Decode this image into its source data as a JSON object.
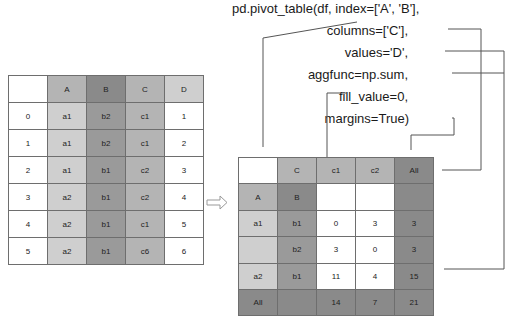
{
  "code": {
    "line1": "pd.pivot_table(df, index=['A', 'B'],",
    "line2": "columns=['C'],",
    "line3": "values='D',",
    "line4": "aggfunc=np.sum,",
    "line5": "fill_value=0,",
    "line6": "margins=True)"
  },
  "source_table": {
    "headers": [
      "",
      "A",
      "B",
      "C",
      "D"
    ],
    "rows": [
      [
        "0",
        "a1",
        "b2",
        "c1",
        "1"
      ],
      [
        "1",
        "a1",
        "b2",
        "c1",
        "2"
      ],
      [
        "2",
        "a1",
        "b1",
        "c2",
        "3"
      ],
      [
        "3",
        "a2",
        "b1",
        "c2",
        "4"
      ],
      [
        "4",
        "a2",
        "b1",
        "c1",
        "5"
      ],
      [
        "5",
        "a2",
        "b1",
        "c6",
        "6"
      ]
    ]
  },
  "arrow": {
    "icon": "hollow-right-arrow-icon"
  },
  "pivot_table": {
    "header_row": [
      "",
      "C",
      "c1",
      "c2",
      "All"
    ],
    "index_row": [
      "A",
      "B",
      "",
      "",
      ""
    ],
    "rows": [
      [
        "a1",
        "b1",
        "0",
        "3",
        "3"
      ],
      [
        "",
        "b2",
        "3",
        "0",
        "3"
      ],
      [
        "a2",
        "b1",
        "11",
        "4",
        "15"
      ],
      [
        "All",
        "",
        "14",
        "7",
        "21"
      ]
    ]
  },
  "colors": {
    "line": "#555555",
    "cell_border": "#6e6e6e",
    "light_gray": "#cfcfcf",
    "mid_gray": "#b4b4b4",
    "dark_gray": "#9a9a9a",
    "darkest_gray": "#8a8a8a"
  }
}
